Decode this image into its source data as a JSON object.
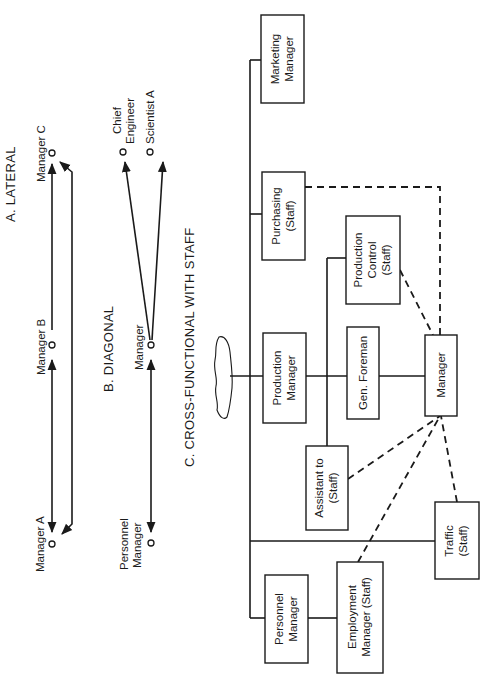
{
  "figure": {
    "sections": [
      {
        "id": "A",
        "title": "A. LATERAL",
        "nodes": [
          {
            "label": "Manager C"
          },
          {
            "label": "Manager B"
          },
          {
            "label": "Manager A"
          }
        ],
        "connections": [
          {
            "from": "Manager B",
            "to": "Manager C",
            "style": "solid",
            "arrow": "both"
          },
          {
            "from": "Manager B",
            "to": "Manager A",
            "style": "solid",
            "arrow": "both"
          },
          {
            "from": "Manager A",
            "to": "Manager C",
            "style": "solid",
            "arrow": "both"
          }
        ]
      },
      {
        "id": "B",
        "title": "B. DIAGONAL",
        "nodes": [
          {
            "label_line1": "Chief",
            "label_line2": "Engineer"
          },
          {
            "label": "Scientist A"
          },
          {
            "label": "Manager"
          },
          {
            "label_line1": "Personnel",
            "label_line2": "Manager"
          }
        ],
        "connections": [
          {
            "from": "Manager",
            "to": "Chief Engineer",
            "style": "solid",
            "arrow": "to"
          },
          {
            "from": "Manager",
            "to": "Scientist A",
            "style": "solid",
            "arrow": "to"
          },
          {
            "from": "Manager",
            "to": "Personnel Manager",
            "style": "solid",
            "arrow": "both"
          }
        ]
      },
      {
        "id": "C",
        "title": "C. CROSS-FUNCTIONAL WITH STAFF",
        "boxes": {
          "marketing": {
            "line1": "Marketing",
            "line2": "Manager"
          },
          "purchasing": {
            "line1": "Purchasing",
            "line2": "(Staff)"
          },
          "production_manager": {
            "line1": "Production",
            "line2": "Manager"
          },
          "production_control": {
            "line1": "Production",
            "line2": "Control",
            "line3": "(Staff)"
          },
          "gen_foreman": {
            "line1": "Gen. Foreman"
          },
          "manager": {
            "line1": "Manager"
          },
          "assistant": {
            "line1": "Assistant to",
            "line2": "(Staff)"
          },
          "traffic": {
            "line1": "Traffic",
            "line2": "(Staff)"
          },
          "personnel_manager": {
            "line1": "Personnel",
            "line2": "Manager"
          },
          "employment_manager": {
            "line1": "Employment",
            "line2": "Manager (Staff)"
          }
        },
        "connections": [
          {
            "from": "Manager",
            "to": "Purchasing (Staff)",
            "style": "dashed"
          },
          {
            "from": "Manager",
            "to": "Production Control (Staff)",
            "style": "dashed"
          },
          {
            "from": "Manager",
            "to": "Assistant to (Staff)",
            "style": "dashed"
          },
          {
            "from": "Manager",
            "to": "Employment Manager (Staff)",
            "style": "dashed"
          },
          {
            "from": "Manager",
            "to": "Traffic (Staff)",
            "style": "dashed"
          },
          {
            "from": "Gen. Foreman",
            "to": "Manager",
            "style": "solid"
          },
          {
            "from": "Production Manager",
            "to": "Gen. Foreman",
            "style": "solid"
          },
          {
            "from": "Personnel Manager",
            "to": "Employment Manager (Staff)",
            "style": "solid"
          }
        ]
      }
    ],
    "orientation": "rotated 90 degrees counter-clockwise",
    "colors": {
      "ink": "#1a1a1a",
      "background": "#ffffff"
    }
  }
}
